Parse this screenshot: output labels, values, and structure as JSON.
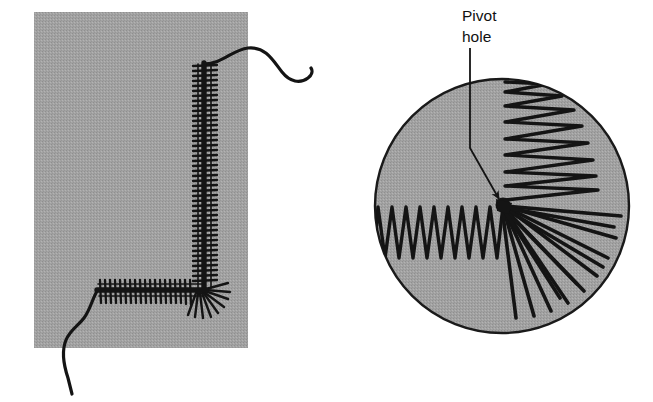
{
  "figure": {
    "background_color": "#ffffff",
    "ink_color": "#1a1a1a",
    "panels": [
      {
        "name": "left-panel",
        "description": "Gray rectangular plate with a tightly wound coil spring bent around a right-angle corner, with free wire tails exiting top-right and bottom-left",
        "shape": "rectangle",
        "fill_color": "#9e9e9e",
        "x": 34,
        "y": 12,
        "width": 214,
        "height": 336
      },
      {
        "name": "right-panel",
        "description": "Gray disc with the same coil collapsed radially about a central pivot hole, forming a zigzag fan",
        "shape": "circle",
        "fill_color": "#9e9e9e",
        "stroke_color": "#1a1a1a",
        "center_x": 502,
        "center_y": 206,
        "radius": 128
      }
    ],
    "callout": {
      "label_line1": "Pivot",
      "label_line2": "hole",
      "label_x": 462,
      "label_y": 22,
      "leader": {
        "from_x": 470,
        "from_y": 46,
        "bend_x": 470,
        "bend_y": 148,
        "to_x": 503,
        "to_y": 202,
        "arrowhead": "triangle"
      }
    },
    "left_coil": {
      "vertical_run": {
        "x": 205,
        "y_top": 62,
        "y_bottom": 290,
        "coil_count": 46,
        "coil_half_width": 12
      },
      "horizontal_run": {
        "y": 290,
        "x_left": 96,
        "x_right": 205,
        "coil_count": 22,
        "coil_half_width": 12
      },
      "corner_fan": {
        "center_x": 205,
        "center_y": 290,
        "ray_count": 9,
        "inner_radius": 3,
        "outer_radius": 24
      },
      "tail_top": {
        "start_x": 205,
        "start_y": 62,
        "end_x": 313,
        "end_y": 78
      },
      "tail_bottom": {
        "start_x": 96,
        "start_y": 290,
        "end_x": 72,
        "end_y": 393
      }
    },
    "right_coil": {
      "pivot_x": 503,
      "pivot_y": 205,
      "hub_radius": 7,
      "horizontal_zigzag": {
        "x_left": 378,
        "x_right": 503,
        "y_center": 232,
        "amplitude": 25,
        "teeth": 17
      },
      "vertical_zigzag": {
        "y_top": 82,
        "y_bottom": 200,
        "x_center": 505,
        "amplitude": 0,
        "teeth": 15,
        "outer_x_max": 602
      },
      "radial_fan": {
        "ray_count": 13,
        "angle_start_deg": 5,
        "angle_end_deg": 72,
        "inner_radius": 6,
        "outer_radius": 118
      }
    }
  }
}
